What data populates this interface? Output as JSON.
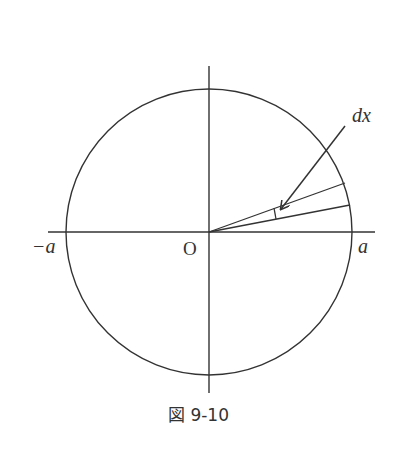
{
  "figure": {
    "caption": "図 9-10",
    "labels": {
      "origin": "O",
      "neg_a": "−a",
      "pos_a": "a",
      "dx": "dx"
    },
    "colors": {
      "stroke": "#333333",
      "background": "#ffffff"
    }
  }
}
